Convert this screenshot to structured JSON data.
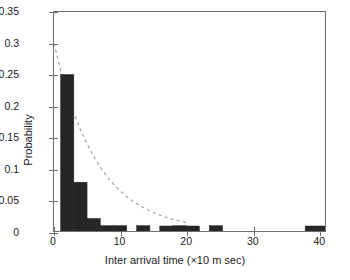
{
  "chart_data": {
    "type": "bar",
    "title": "",
    "subtitle": "",
    "xlabel": "Inter arrival time (×10 m sec)",
    "ylabel": "Probability",
    "xlim": [
      0,
      41
    ],
    "ylim": [
      0,
      0.35
    ],
    "xticks": [
      0,
      10,
      20,
      30,
      40
    ],
    "xticklabels": [
      "0",
      "10",
      "20",
      "30",
      "40"
    ],
    "yticks": [
      0,
      0.05,
      0.1,
      0.15,
      0.2,
      0.25,
      0.3,
      0.35
    ],
    "yticklabels": [
      "0",
      "0.05",
      "0.1",
      "0.15",
      "0.2",
      "0.25",
      "0.3",
      "0.35"
    ],
    "grid": false,
    "legend": null,
    "legend_position": "none",
    "bar_color": "#262626",
    "bar_edge_color": "#262626",
    "bar_width": 2,
    "series": [
      {
        "name": "Measured probability",
        "type": "bar",
        "x": [
          2,
          4,
          6,
          8,
          10,
          13.5,
          17,
          19,
          21,
          24.5,
          39,
          41
        ],
        "values": [
          0.25,
          0.078,
          0.02,
          0.0085,
          0.0085,
          0.0085,
          0.008,
          0.0085,
          0.008,
          0.0085,
          0.008,
          0.008
        ]
      },
      {
        "name": "Exponential fit",
        "type": "line",
        "style": "dashed",
        "color": "#9a9a9a",
        "x": [
          0,
          1,
          2,
          3,
          4,
          5,
          6,
          7,
          8,
          9,
          10,
          11,
          12,
          13,
          14,
          15,
          16,
          17,
          18,
          19,
          20
        ],
        "values": [
          0.3,
          0.257,
          0.22,
          0.189,
          0.162,
          0.139,
          0.119,
          0.102,
          0.0874,
          0.0749,
          0.0642,
          0.055,
          0.0471,
          0.0404,
          0.0346,
          0.0297,
          0.0254,
          0.0218,
          0.0187,
          0.016,
          0.0137
        ]
      }
    ],
    "annotations": []
  },
  "figure": {
    "background_color": "#ffffff",
    "axis_color": "#6f6f6f",
    "text_color": "#1a1a1a"
  }
}
